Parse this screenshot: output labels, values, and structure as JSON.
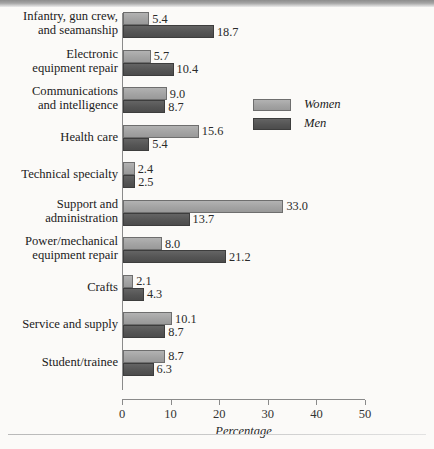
{
  "chart_data": {
    "type": "bar",
    "orientation": "horizontal",
    "title": "",
    "xlabel": "Percentage",
    "ylabel": "",
    "xlim": [
      0,
      50
    ],
    "xticks": [
      0,
      10,
      20,
      30,
      40,
      50
    ],
    "grid": false,
    "legend_position": "inside-upper-right",
    "categories": [
      "Infantry, gun crew, and seamanship",
      "Electronic equipment repair",
      "Communications and intelligence",
      "Health care",
      "Technical  specialty",
      "Support and administration",
      "Power/mechanical equipment repair",
      "Crafts",
      "Service and supply",
      "Student/trainee"
    ],
    "series": [
      {
        "name": "Women",
        "color": "#a3a3a3",
        "values": [
          5.4,
          5.7,
          9.0,
          15.6,
          2.4,
          33.0,
          8.0,
          2.1,
          10.1,
          8.7
        ]
      },
      {
        "name": "Men",
        "color": "#555555",
        "values": [
          18.7,
          10.4,
          8.7,
          5.4,
          2.5,
          13.7,
          21.2,
          4.3,
          8.7,
          6.3
        ]
      }
    ],
    "value_labels": {
      "women": [
        "5.4",
        "5.7",
        "9.0",
        "15.6",
        "2.4",
        "33.0",
        "8.0",
        "2.1",
        "10.1",
        "8.7"
      ],
      "men": [
        "18.7",
        "10.4",
        "8.7",
        "5.4",
        "2.5",
        "13.7",
        "21.2",
        "4.3",
        "8.7",
        "6.3"
      ]
    }
  },
  "category_lines": [
    [
      "Infantry, gun crew,",
      "and seamanship"
    ],
    [
      "Electronic",
      "equipment repair"
    ],
    [
      "Communications",
      "and intelligence"
    ],
    [
      "Health care"
    ],
    [
      "Technical  specialty"
    ],
    [
      "Support and",
      "administration"
    ],
    [
      "Power/mechanical",
      "equipment repair"
    ],
    [
      "Crafts"
    ],
    [
      "Service and supply"
    ],
    [
      "Student/trainee"
    ]
  ],
  "axis": {
    "tick_labels": [
      "0",
      "10",
      "20",
      "30",
      "40",
      "50"
    ],
    "title": "Percentage"
  },
  "legend": {
    "items": [
      {
        "label": "Women",
        "swatch": "women"
      },
      {
        "label": "Men",
        "swatch": "men"
      }
    ]
  },
  "footer": {
    "ghost_text": ""
  }
}
